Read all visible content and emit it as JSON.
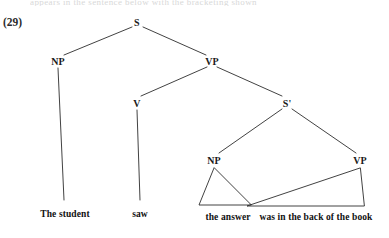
{
  "figure": {
    "example_number": "(29)",
    "cutoff_text_above": "appears in the sentence below with the bracketing shown",
    "nodes": [
      {
        "id": "s-root",
        "label": "S",
        "x": 137,
        "y": 22
      },
      {
        "id": "np-subj",
        "label": "NP",
        "x": 58,
        "y": 61
      },
      {
        "id": "vp-main",
        "label": "VP",
        "x": 212,
        "y": 61
      },
      {
        "id": "v-main",
        "label": "V",
        "x": 137,
        "y": 103
      },
      {
        "id": "sbar",
        "label": "S'",
        "x": 287,
        "y": 103
      },
      {
        "id": "np-embed",
        "label": "NP",
        "x": 214,
        "y": 160
      },
      {
        "id": "vp-embed",
        "label": "VP",
        "x": 360,
        "y": 160
      }
    ],
    "leaves": [
      {
        "id": "leaf-subject",
        "text": "The student",
        "x": 65,
        "y": 209
      },
      {
        "id": "leaf-verb",
        "text": "saw",
        "x": 140,
        "y": 209
      },
      {
        "id": "leaf-embed-np",
        "text": "the answer",
        "x": 228,
        "y": 212
      },
      {
        "id": "leaf-embed-vp",
        "text": "was in the back of the book",
        "x": 316,
        "y": 212
      }
    ],
    "colors": {
      "line": "#2d2d2d",
      "text": "#111111",
      "background": "#ffffff"
    }
  }
}
